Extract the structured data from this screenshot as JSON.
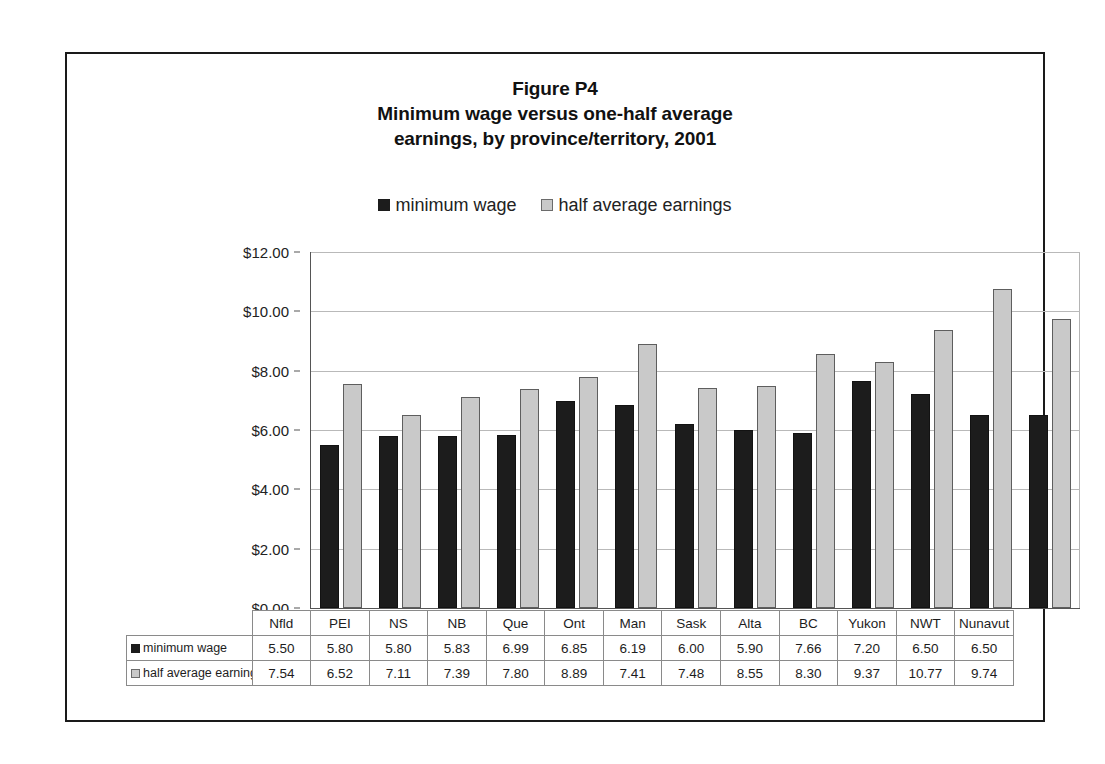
{
  "figure": {
    "title_lines": [
      "Figure P4",
      "Minimum wage versus one-half average",
      "earnings, by province/territory, 2001"
    ]
  },
  "legend": {
    "entries": [
      {
        "label": "minimum wage",
        "swatch": "dark-square-icon",
        "color": "#1c1c1c"
      },
      {
        "label": "half average earnings",
        "swatch": "light-square-icon",
        "color": "#c9c9c9"
      }
    ]
  },
  "axis": {
    "y_ticks": [
      "$12.00",
      "$10.00",
      "$8.00",
      "$6.00",
      "$4.00",
      "$2.00",
      "$0.00"
    ]
  },
  "table": {
    "row_labels": [
      "minimum wage",
      "half average earnings"
    ]
  },
  "chart_data": {
    "type": "bar",
    "xlabel": "",
    "ylabel": "",
    "ylim": [
      0,
      12
    ],
    "ytick_values": [
      0,
      2,
      4,
      6,
      8,
      10,
      12
    ],
    "grid": true,
    "legend_position": "top-center",
    "categories": [
      "Nfld",
      "PEI",
      "NS",
      "NB",
      "Que",
      "Ont",
      "Man",
      "Sask",
      "Alta",
      "BC",
      "Yukon",
      "NWT",
      "Nunavut"
    ],
    "series": [
      {
        "name": "minimum wage",
        "color": "#1c1c1c",
        "values": [
          5.5,
          5.8,
          5.8,
          5.83,
          6.99,
          6.85,
          6.19,
          6.0,
          5.9,
          7.66,
          7.2,
          6.5,
          6.5
        ],
        "labels": [
          "5.50",
          "5.80",
          "5.80",
          "5.83",
          "6.99",
          "6.85",
          "6.19",
          "6.00",
          "5.90",
          "7.66",
          "7.20",
          "6.50",
          "6.50"
        ]
      },
      {
        "name": "half average earnings",
        "color": "#c9c9c9",
        "values": [
          7.54,
          6.52,
          7.11,
          7.39,
          7.8,
          8.89,
          7.41,
          7.48,
          8.55,
          8.3,
          9.37,
          10.77,
          9.74
        ],
        "labels": [
          "7.54",
          "6.52",
          "7.11",
          "7.39",
          "7.80",
          "8.89",
          "7.41",
          "7.48",
          "8.55",
          "8.30",
          "9.37",
          "10.77",
          "9.74"
        ]
      }
    ]
  }
}
